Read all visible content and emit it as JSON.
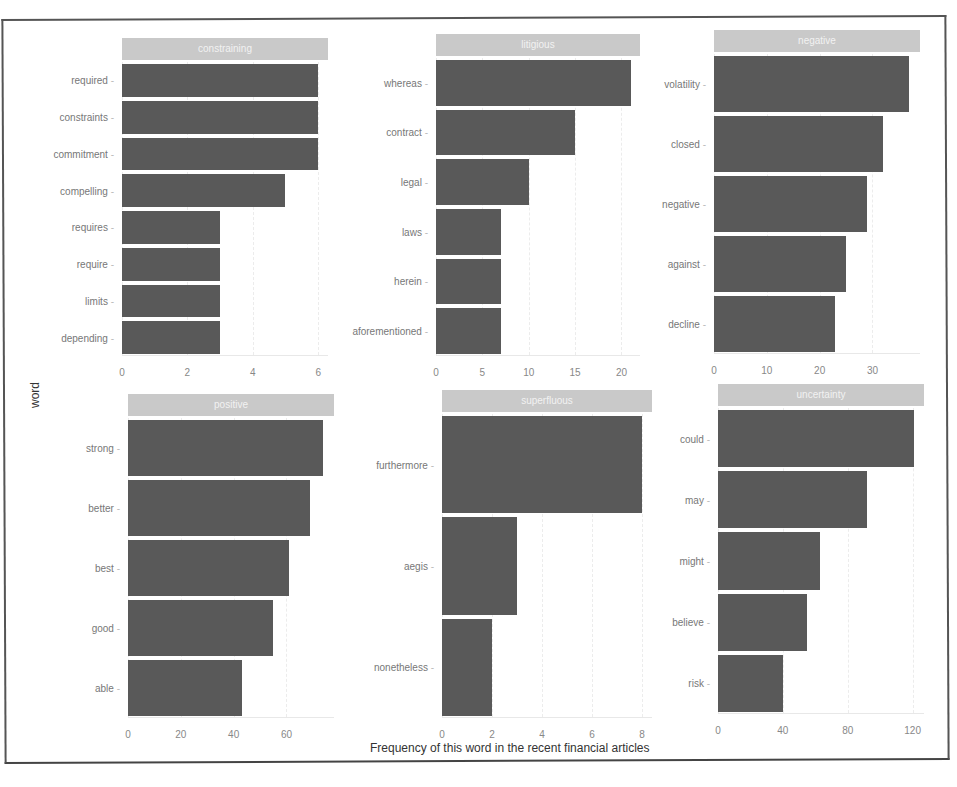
{
  "chart_data": {
    "type": "bar",
    "orientation": "horizontal",
    "layout": "facet_wrap 2x3, free scales",
    "xlabel": "Frequency of this word in the recent financial articles",
    "ylabel": "word",
    "bar_color": "#595959",
    "strip_color": "#c9c9c9",
    "facets": [
      {
        "name": "constraining",
        "categories": [
          "required",
          "constraints",
          "commitment",
          "compelling",
          "requires",
          "require",
          "limits",
          "depending"
        ],
        "values": [
          6,
          6,
          6,
          5,
          3,
          3,
          3,
          3
        ],
        "xticks": [
          0,
          2,
          4,
          6
        ],
        "xlim": [
          0,
          6.3
        ]
      },
      {
        "name": "litigious",
        "categories": [
          "whereas",
          "contract",
          "legal",
          "laws",
          "herein",
          "aforementioned"
        ],
        "values": [
          21,
          15,
          10,
          7,
          7,
          7
        ],
        "xticks": [
          0,
          5,
          10,
          15,
          20
        ],
        "xlim": [
          0,
          22
        ]
      },
      {
        "name": "negative",
        "categories": [
          "volatility",
          "closed",
          "negative",
          "against",
          "decline"
        ],
        "values": [
          37,
          32,
          29,
          25,
          23
        ],
        "xticks": [
          0,
          10,
          20,
          30
        ],
        "xlim": [
          0,
          39
        ]
      },
      {
        "name": "positive",
        "categories": [
          "strong",
          "better",
          "best",
          "good",
          "able"
        ],
        "values": [
          74,
          69,
          61,
          55,
          43
        ],
        "xticks": [
          0,
          20,
          40,
          60
        ],
        "xlim": [
          0,
          78
        ]
      },
      {
        "name": "superfluous",
        "categories": [
          "furthermore",
          "aegis",
          "nonetheless"
        ],
        "values": [
          8,
          3,
          2
        ],
        "xticks": [
          0,
          2,
          4,
          6,
          8
        ],
        "xlim": [
          0,
          8.4
        ]
      },
      {
        "name": "uncertainty",
        "categories": [
          "could",
          "may",
          "might",
          "believe",
          "risk"
        ],
        "values": [
          121,
          92,
          63,
          55,
          40
        ],
        "xticks": [
          0,
          40,
          80,
          120
        ],
        "xlim": [
          0,
          127
        ]
      }
    ]
  }
}
